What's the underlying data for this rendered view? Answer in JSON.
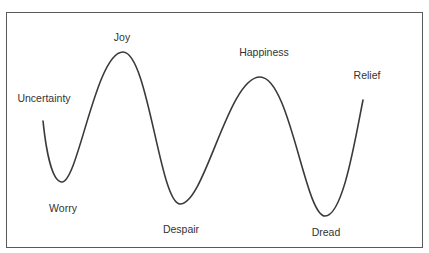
{
  "diagram": {
    "type": "emotional-wave",
    "line_color": "#3a3a3a",
    "labels": [
      {
        "id": "uncertainty",
        "text": "Uncertainty",
        "x": 44,
        "y": 92
      },
      {
        "id": "joy",
        "text": "Joy",
        "x": 122,
        "y": 31
      },
      {
        "id": "worry",
        "text": "Worry",
        "x": 63,
        "y": 202
      },
      {
        "id": "happiness",
        "text": "Happiness",
        "x": 264,
        "y": 46
      },
      {
        "id": "despair",
        "text": "Despair",
        "x": 181,
        "y": 223
      },
      {
        "id": "relief",
        "text": "Relief",
        "x": 367,
        "y": 69
      },
      {
        "id": "dread",
        "text": "Dread",
        "x": 326,
        "y": 226
      }
    ],
    "curve_points": [
      {
        "x": 43,
        "y": 121,
        "label": "start"
      },
      {
        "x": 62,
        "y": 182,
        "label": "Worry"
      },
      {
        "x": 123,
        "y": 52,
        "label": "Joy"
      },
      {
        "x": 180,
        "y": 204,
        "label": "Despair"
      },
      {
        "x": 260,
        "y": 77,
        "label": "Happiness"
      },
      {
        "x": 325,
        "y": 216,
        "label": "Dread"
      },
      {
        "x": 363,
        "y": 100,
        "label": "Relief"
      }
    ]
  }
}
